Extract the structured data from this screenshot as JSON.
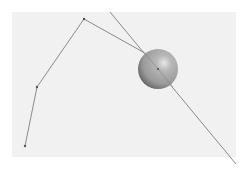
{
  "figure": {
    "type": "kinematic-chain-with-sphere",
    "background_color": "#ffffff",
    "panel_color": "#f1f1f1",
    "line_color": "#8a8a8a",
    "joint_color": "#555555",
    "chain": {
      "vertices": [
        {
          "x": 25,
          "y": 146
        },
        {
          "x": 37,
          "y": 87
        },
        {
          "x": 84,
          "y": 19
        },
        {
          "x": 143,
          "y": 52
        }
      ]
    },
    "ray": {
      "start": {
        "x": 110,
        "y": 12
      },
      "end": {
        "x": 236,
        "y": 164
      }
    },
    "sphere": {
      "cx": 158,
      "cy": 69,
      "r": 20,
      "highlight": {
        "x": 165,
        "y": 62
      },
      "color_light": "#e8e8e8",
      "color_mid": "#9a9a9a",
      "color_dark": "#5c5c5c"
    }
  }
}
